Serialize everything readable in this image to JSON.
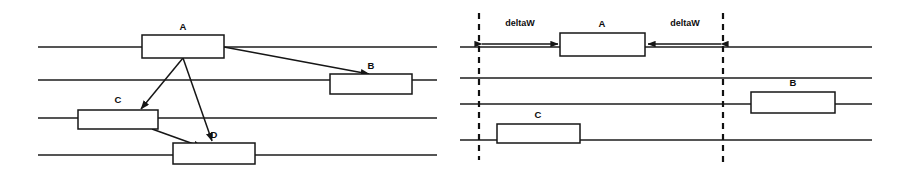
{
  "figure": {
    "background_color": "#ffffff",
    "line_color": "#1c1c1c",
    "box_fill": "#ffffff",
    "box_stroke": "#161616",
    "dashed_guide_color": "#111111"
  },
  "panels": [
    {
      "id": "left-panel",
      "name": "dependency-panel",
      "lane_count": 4,
      "lanes_y": [
        47,
        80,
        118,
        155
      ],
      "lane_x_start": 38,
      "lane_x_end": 437,
      "boxes": [
        {
          "label": "A",
          "x": 142,
          "y": 35,
          "width": 82,
          "height": 23,
          "label_x": 183,
          "label_y": 30
        },
        {
          "label": "B",
          "x": 330,
          "y": 74,
          "width": 82,
          "height": 20,
          "label_x": 371,
          "label_y": 69
        },
        {
          "label": "C",
          "x": 78,
          "y": 110,
          "width": 80,
          "height": 19,
          "label_x": 118,
          "label_y": 103
        },
        {
          "label": "D",
          "x": 173,
          "y": 143,
          "width": 82,
          "height": 21,
          "label_x": 214,
          "label_y": 138
        }
      ],
      "arrows": [
        {
          "name": "a-to-b",
          "from_x": 224,
          "from_y": 47,
          "to_x": 369,
          "to_y": 74
        },
        {
          "name": "a-to-c",
          "from_x": 183,
          "from_y": 58,
          "to_x": 141,
          "to_y": 109
        },
        {
          "name": "a-to-d",
          "from_x": 183,
          "from_y": 58,
          "to_x": 212,
          "to_y": 141
        },
        {
          "name": "c-to-d",
          "from_x": 152,
          "from_y": 129,
          "to_x": 202,
          "to_y": 147
        }
      ]
    },
    {
      "id": "right-panel",
      "name": "deltaw-panel",
      "lane_count": 4,
      "lanes_y": [
        47,
        78,
        104,
        140
      ],
      "lane_x_start": 460,
      "lane_x_end": 872,
      "boxes": [
        {
          "label": "A",
          "x": 560,
          "y": 33,
          "width": 85,
          "height": 23,
          "label_x": 602,
          "label_y": 27
        },
        {
          "label": "B",
          "x": 751,
          "y": 92,
          "width": 84,
          "height": 21,
          "label_x": 793,
          "label_y": 86
        },
        {
          "label": "C",
          "x": 497,
          "y": 124,
          "width": 83,
          "height": 19,
          "label_x": 538,
          "label_y": 118
        }
      ],
      "guides": [
        {
          "name": "left-window-guide",
          "x": 479,
          "y_top": 13,
          "y_bottom": 160
        },
        {
          "name": "right-window-guide",
          "x": 723,
          "y_top": 13,
          "y_bottom": 162
        }
      ],
      "measures": [
        {
          "label": "deltaW",
          "x_from": 482,
          "x_to": 558,
          "y": 44,
          "label_x": 520,
          "label_y": 26
        },
        {
          "label": "deltaW",
          "x_from": 721,
          "x_to": 648,
          "y": 44,
          "label_x": 685,
          "label_y": 26
        }
      ]
    }
  ]
}
